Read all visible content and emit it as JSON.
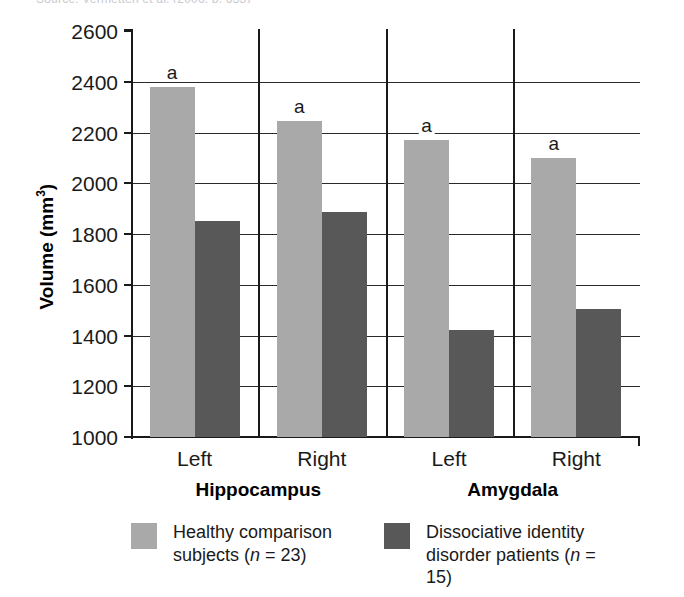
{
  "top_caption_remnant": "Source: Vermetten et al. (2006, p. 633)",
  "chart_data": {
    "type": "bar",
    "title": "",
    "subtitle": "",
    "xlabel": "",
    "ylabel": "Volume (mm³)",
    "ylim": [
      1000,
      2600
    ],
    "ytick_step": 200,
    "yticks": [
      2600,
      2400,
      2200,
      2000,
      1800,
      1600,
      1400,
      1200,
      1000
    ],
    "grid": true,
    "grid_axis": "y",
    "legend_position": "bottom",
    "categories": [
      "Left",
      "Right",
      "Left",
      "Right"
    ],
    "group_labels": [
      "Hippocampus",
      "Amygdala"
    ],
    "series": [
      {
        "name": "Healthy comparison subjects (n = 23)",
        "color": "#a9a9a9",
        "values": [
          2380,
          2245,
          2170,
          2100
        ]
      },
      {
        "name": "Dissociative identity disorder patients (n = 15)",
        "color": "#585858",
        "values": [
          1850,
          1885,
          1420,
          1505
        ]
      }
    ],
    "annotations": [
      {
        "text": "a",
        "category_index": 0,
        "series_index": 0
      },
      {
        "text": "a",
        "category_index": 1,
        "series_index": 0
      },
      {
        "text": "a",
        "category_index": 2,
        "series_index": 0
      },
      {
        "text": "a",
        "category_index": 3,
        "series_index": 0
      }
    ]
  },
  "axis": {
    "ytick_labels": [
      "2600",
      "2400",
      "2200",
      "2000",
      "1800",
      "1600",
      "1400",
      "1200",
      "1000"
    ],
    "xtick_labels": [
      "Left",
      "Right",
      "Left",
      "Right"
    ],
    "ylabel_main": "Volume (mm",
    "ylabel_sup": "3",
    "ylabel_close": ")"
  },
  "region_labels": {
    "left": "Hippocampus",
    "right": "Amygdala"
  },
  "legend": {
    "items": [
      {
        "swatch": "light",
        "line1": "Healthy comparison",
        "line2_prefix": "subjects (",
        "line2_italic": "n",
        "line2_suffix": " = 23)"
      },
      {
        "swatch": "dark",
        "line1": "Dissociative identity",
        "line2_prefix": "disorder patients (",
        "line2_italic": "n",
        "line2_suffix": " = 15)"
      }
    ]
  },
  "significance_marker": "a"
}
